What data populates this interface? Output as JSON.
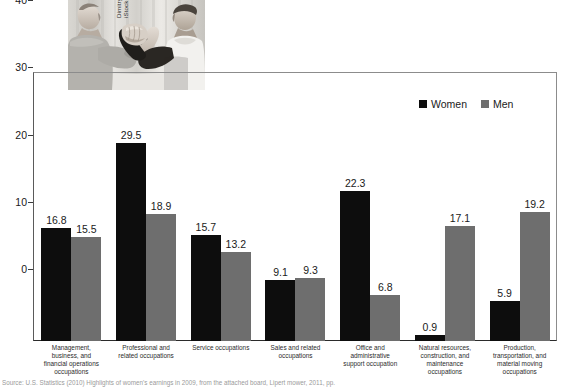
{
  "photo": {
    "credit": "Dimitry Shironosov/\niStockphoto",
    "alt_name": "arm-wrestling-photo"
  },
  "legend": {
    "position": "top-right",
    "items": [
      {
        "label": "Women",
        "color": "#0d0d0d"
      },
      {
        "label": "Men",
        "color": "#6e6e6e"
      }
    ]
  },
  "source": {
    "text": "Source: U.S. Statistics (2010) Highlights of women's earnings in 2009, from the attached board, Lipert mower, 2011, pp."
  },
  "chart_data": {
    "type": "bar",
    "title": "",
    "subtitle": "",
    "xlabel": "",
    "ylabel": "",
    "ylim": [
      0,
      40
    ],
    "yticks": [
      0,
      10,
      20,
      30,
      40
    ],
    "grid": false,
    "legend_position": "top-right",
    "categories": [
      "Management,\nbusiness, and\nfinancial operations\noccupations",
      "Professional and\nrelated occupations",
      "Service occupations",
      "Sales and related\noccupations",
      "Office and\nadministrative\nsupport occupation",
      "Natural resources,\nconstruction, and\nmaintenance\noccupations",
      "Production,\ntransportation, and\nmaterial moving\noccupations"
    ],
    "series": [
      {
        "name": "Women",
        "color": "#0d0d0d",
        "values": [
          16.8,
          29.5,
          15.7,
          9.1,
          22.3,
          0.9,
          5.9
        ]
      },
      {
        "name": "Men",
        "color": "#6e6e6e",
        "values": [
          15.5,
          18.9,
          13.2,
          9.3,
          6.8,
          17.1,
          19.2
        ]
      }
    ],
    "data_labels": [
      [
        "16.8",
        "15.5"
      ],
      [
        "29.5",
        "18.9"
      ],
      [
        "15.7",
        "13.2"
      ],
      [
        "9.1",
        "9.3"
      ],
      [
        "22.3",
        "6.8"
      ],
      [
        "0.9",
        "17.1"
      ],
      [
        "5.9",
        "19.2"
      ]
    ]
  }
}
